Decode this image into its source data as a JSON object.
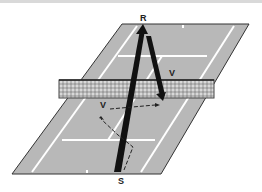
{
  "diagram": {
    "labels": {
      "receiver": "R",
      "server": "S",
      "volley_far": "V",
      "volley_near": "V"
    },
    "colors": {
      "court": "#b8b8b8",
      "lines": "#ffffff",
      "outline": "#333333",
      "shot": "#111111",
      "net": "#444444"
    }
  }
}
